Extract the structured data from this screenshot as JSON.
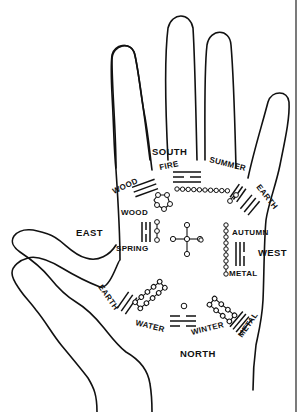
{
  "directions": {
    "north": "NORTH",
    "south": "SOUTH",
    "east": "EAST",
    "west": "WEST"
  },
  "labels": {
    "wood_top": "WOOD",
    "fire": "FIRE",
    "summer": "SUMMER",
    "earth_top": "EARTH",
    "wood_left": "WOOD",
    "spring": "SPRING",
    "autumn": "AUTUMN",
    "metal_right": "METAL",
    "earth_bottom": "EARTH",
    "water": "WATER",
    "winter": "WINTER",
    "metal_bottom": "METAL"
  },
  "colors": {
    "ink": "#111111",
    "background": "#ffffff"
  }
}
